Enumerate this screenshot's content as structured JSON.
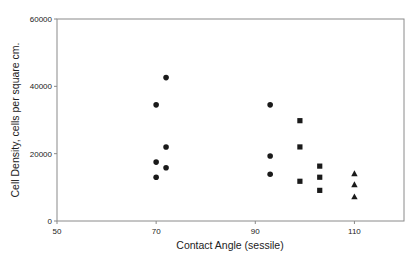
{
  "chart_data": {
    "type": "scatter",
    "title": "",
    "xlabel": "Contact Angle (sessile)",
    "ylabel": "Cell Density, cells per square cm.",
    "xlim": [
      50,
      120
    ],
    "ylim": [
      0,
      60000
    ],
    "xticks": [
      50,
      70,
      90,
      110
    ],
    "xtick_labels": [
      "50",
      "70",
      "90",
      "110"
    ],
    "yticks": [
      0,
      20000,
      40000,
      60000
    ],
    "ytick_labels": [
      "0",
      "20000",
      "40000",
      "60000"
    ],
    "grid": false,
    "legend": null,
    "series": [
      {
        "name": "circles",
        "marker": "circle",
        "color": "#1a1a1a",
        "points": [
          {
            "x": 72,
            "y": 42600
          },
          {
            "x": 70,
            "y": 34500
          },
          {
            "x": 72,
            "y": 22000
          },
          {
            "x": 70,
            "y": 17500
          },
          {
            "x": 72,
            "y": 15800
          },
          {
            "x": 70,
            "y": 13000
          },
          {
            "x": 93,
            "y": 34500
          },
          {
            "x": 93,
            "y": 19300
          },
          {
            "x": 93,
            "y": 13900
          }
        ]
      },
      {
        "name": "squares",
        "marker": "square",
        "color": "#1a1a1a",
        "points": [
          {
            "x": 99,
            "y": 29800
          },
          {
            "x": 99,
            "y": 22000
          },
          {
            "x": 99,
            "y": 11800
          },
          {
            "x": 103,
            "y": 16300
          },
          {
            "x": 103,
            "y": 13000
          },
          {
            "x": 103,
            "y": 9100
          }
        ]
      },
      {
        "name": "triangles",
        "marker": "triangle",
        "color": "#1a1a1a",
        "points": [
          {
            "x": 110,
            "y": 14100
          },
          {
            "x": 110,
            "y": 10800
          },
          {
            "x": 110,
            "y": 7200
          }
        ]
      }
    ]
  }
}
